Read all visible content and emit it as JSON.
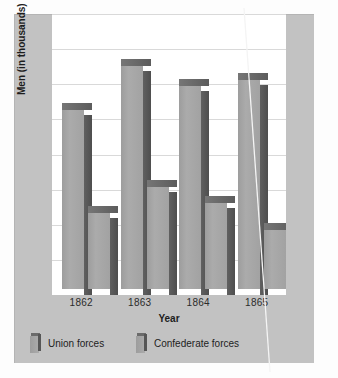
{
  "chart_data": {
    "type": "bar",
    "title": "",
    "xlabel": "Year",
    "ylabel": "Men (in thousands)",
    "categories": [
      "1862",
      "1863",
      "1864",
      "1865"
    ],
    "series": [
      {
        "name": "Union forces",
        "values": [
          540,
          670,
          610,
          630
        ]
      },
      {
        "name": "Confederate forces",
        "values": [
          230,
          310,
          260,
          180
        ]
      }
    ],
    "ylim": [
      0,
      800
    ],
    "yticks": [
      0,
      100,
      200,
      300,
      400,
      500,
      600,
      700,
      800
    ],
    "ytick_labels_shown": false,
    "gridlines": 8,
    "grid": true,
    "legend_position": "bottom-left",
    "bar_style": "3d",
    "colors": {
      "bar_face": "#a3a3a3",
      "bar_side": "#585858",
      "bar_top": "#6e6e6e",
      "panel_background": "#c2c2c2",
      "plot_background": "#ffffff",
      "gridline": "#d9d9d9",
      "text": "#1d1d1d"
    }
  },
  "axes": {
    "x_label": "Year",
    "y_label": "Men (in thousands)",
    "x_ticks": [
      "1862",
      "1863",
      "1864",
      "1865"
    ]
  },
  "legend": {
    "items": [
      {
        "label": "Union forces",
        "icon": "bar-swatch-icon"
      },
      {
        "label": "Confederate forces",
        "icon": "bar-swatch-icon"
      }
    ]
  },
  "artifact": {
    "name": "scan-scratch-line",
    "description": "thin white diagonal scratch"
  }
}
